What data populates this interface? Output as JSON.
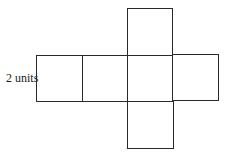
{
  "diagram": {
    "label": "2 units",
    "stroke_color": "#2a2a2a",
    "background": "#ffffff",
    "squares": [
      {
        "name": "left",
        "x": 36,
        "y": 55,
        "w": 46,
        "h": 46
      },
      {
        "name": "center-left",
        "x": 82,
        "y": 55,
        "w": 45,
        "h": 46
      },
      {
        "name": "center",
        "x": 127,
        "y": 55,
        "w": 45,
        "h": 46
      },
      {
        "name": "right",
        "x": 172,
        "y": 54,
        "w": 46,
        "h": 46
      },
      {
        "name": "top",
        "x": 127,
        "y": 8,
        "w": 45,
        "h": 47
      },
      {
        "name": "bottom",
        "x": 127,
        "y": 101,
        "w": 46,
        "h": 47
      }
    ]
  }
}
